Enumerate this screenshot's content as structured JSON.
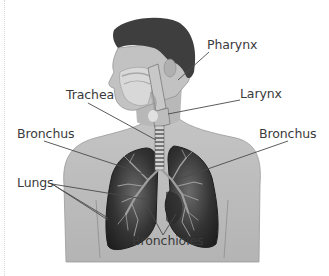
{
  "diagram": {
    "colors": {
      "background": "#ffffff",
      "skin": "#bdbdbd",
      "skin_light": "#d4d4d4",
      "hair": "#3e3e3e",
      "lung_dark": "#2b2b2b",
      "lung_mid": "#5a5a5a",
      "bronchi": "#9a9a9a",
      "label_text": "#3a3a3a",
      "leader_line": "#4a4a4a"
    },
    "labels": [
      {
        "id": "pharynx",
        "text": "Pharynx"
      },
      {
        "id": "trachea",
        "text": "Trachea"
      },
      {
        "id": "larynx",
        "text": "Larynx"
      },
      {
        "id": "bronchus_left",
        "text": "Bronchus"
      },
      {
        "id": "bronchus_right",
        "text": "Bronchus"
      },
      {
        "id": "lungs",
        "text": "Lungs"
      },
      {
        "id": "bronchioles",
        "text": "Bronchioles"
      }
    ]
  }
}
